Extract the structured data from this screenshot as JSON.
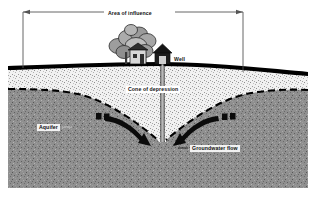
{
  "figure": {
    "type": "cross-section-diagram",
    "width": 316,
    "height": 197
  },
  "labels": {
    "area_of_influence": "Area of influence",
    "well": "Well",
    "cone_of_depression": "Cone of depression",
    "aquifer": "Aquifer",
    "groundwater_flow": "Groundwater flow"
  },
  "colors": {
    "background": "#ffffff",
    "ground_line": "#000000",
    "unsaturated_zone": "#f0f0f0",
    "aquifer_fill": "#8c8c8c",
    "water_table": "#000000",
    "tree_foliage": "#9a9a9a",
    "structure": "#1a1a1a",
    "dimension_line": "#555555"
  },
  "features": {
    "ground_surface": "undulating thick black land-surface line",
    "unsaturated_zone": "light stippled soil band below land surface",
    "water_table": "dashed line drawn down into a V at the well",
    "aquifer": "dark speckled saturated zone filling lower diagram",
    "well_casing": "thin vertical pipe from wellhead into aquifer",
    "flow_arrows": "two curved arrows converging on the well",
    "dimension_span": "double-headed horizontal measure above ground"
  },
  "icons": {
    "trees": "tree-icon",
    "house": "house-icon",
    "wellhead": "wellhead-icon",
    "left_arrow": "flow-arrow-left-icon",
    "right_arrow": "flow-arrow-right-icon",
    "span_left_cap": "dimension-arrow-left-icon",
    "span_right_cap": "dimension-arrow-right-icon"
  }
}
